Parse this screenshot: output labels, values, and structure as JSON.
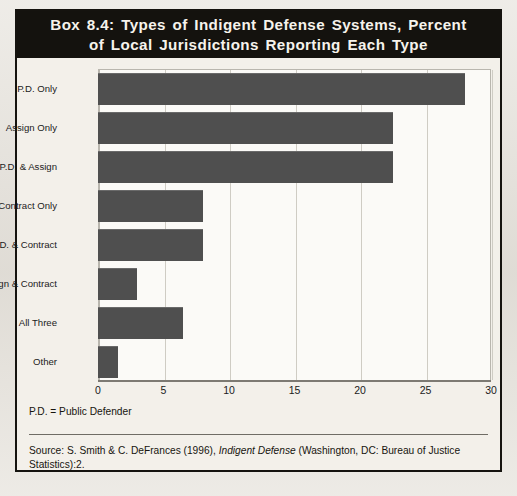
{
  "box": {
    "title_line_1": "Box 8.4: Types of Indigent Defense Systems, Percent",
    "title_line_2": "of Local Jurisdictions Reporting Each Type",
    "legend_note": "P.D. = Public Defender",
    "source_prefix": "Source: S. Smith & C. DeFrances (1996), ",
    "source_italic": "Indigent Defense",
    "source_suffix": " (Washington, DC: Bureau of Justice Statistics):2."
  },
  "colors": {
    "bar": "#4f4f4f",
    "title_band": "#14120e",
    "title_text": "#f6f3ec",
    "plot_bg": "#fbfaf7",
    "gridline": "#cfccc4",
    "border": "#15130f"
  },
  "chart_data": {
    "type": "bar",
    "orientation": "horizontal",
    "title": "Box 8.4: Types of Indigent Defense Systems, Percent of Local Jurisdictions Reporting Each Type",
    "xlabel": "",
    "ylabel": "",
    "xlim": [
      0,
      30
    ],
    "xticks": [
      0,
      5,
      10,
      15,
      20,
      25,
      30
    ],
    "xtick_labels": [
      "0",
      "5",
      "10",
      "15",
      "20",
      "25",
      "30"
    ],
    "grid": true,
    "legend": false,
    "categories": [
      "P.D. Only",
      "Assign Only",
      "P.D. & Assign",
      "Contract Only",
      "P.D. & Contract",
      "Assign & Contract",
      "All Three",
      "Other"
    ],
    "values": [
      28,
      22.5,
      22.5,
      8,
      8,
      3,
      6.5,
      1.5
    ],
    "units": "percent"
  }
}
